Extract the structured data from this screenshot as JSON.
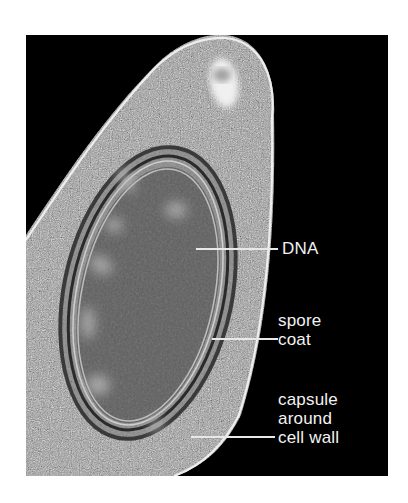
{
  "figure": {
    "background_color": "#000000",
    "labels": [
      {
        "id": "dna",
        "text": "DNA"
      },
      {
        "id": "spore-coat",
        "lines": [
          "spore",
          "coat"
        ]
      },
      {
        "id": "capsule",
        "lines": [
          "capsule",
          "around",
          "cell wall"
        ]
      }
    ]
  }
}
